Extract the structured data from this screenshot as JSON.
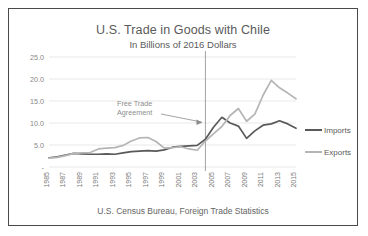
{
  "chart_data": {
    "type": "line",
    "title": "U.S. Trade in Goods with Chile",
    "subtitle": "In Billions of 2016 Dollars",
    "source_note": "U.S. Census Bureau, Foreign Trade Statistics",
    "xlabel": "",
    "ylabel": "",
    "ylim": [
      0,
      25
    ],
    "ytick_labels": [
      "25.0",
      "20.0",
      "15.0",
      "10.0",
      "5.0",
      "-"
    ],
    "ytick_values": [
      25,
      20,
      15,
      10,
      5,
      0
    ],
    "grid": true,
    "legend_position": "right",
    "x": [
      1985,
      1986,
      1987,
      1988,
      1989,
      1990,
      1991,
      1992,
      1993,
      1994,
      1995,
      1996,
      1997,
      1998,
      1999,
      2000,
      2001,
      2002,
      2003,
      2004,
      2005,
      2006,
      2007,
      2008,
      2009,
      2010,
      2011,
      2012,
      2013,
      2014,
      2015
    ],
    "xtick_labels": [
      "1985",
      "1987",
      "1989",
      "1991",
      "1993",
      "1995",
      "1997",
      "1999",
      "2001",
      "2003",
      "2005",
      "2007",
      "2009",
      "2011",
      "2013",
      "2015"
    ],
    "xtick_values": [
      1985,
      1987,
      1989,
      1991,
      1993,
      1995,
      1997,
      1999,
      2001,
      2003,
      2005,
      2007,
      2009,
      2011,
      2013,
      2015
    ],
    "series": [
      {
        "name": "Imports",
        "color": "#595959",
        "values": [
          2.1,
          2.3,
          2.7,
          3.1,
          3.0,
          2.9,
          2.9,
          3.0,
          2.9,
          3.2,
          3.5,
          3.6,
          3.7,
          3.6,
          3.9,
          4.5,
          4.7,
          4.8,
          4.9,
          6.3,
          9.1,
          11.3,
          10.0,
          9.3,
          6.5,
          8.2,
          9.5,
          9.8,
          10.5,
          9.8,
          8.8
        ]
      },
      {
        "name": "Exports",
        "color": "#b5b5b5",
        "values": [
          2.0,
          2.2,
          2.6,
          3.1,
          3.2,
          3.3,
          4.1,
          4.3,
          4.4,
          4.9,
          5.9,
          6.6,
          6.7,
          5.8,
          4.3,
          4.4,
          4.6,
          4.1,
          3.8,
          5.9,
          7.6,
          9.2,
          11.7,
          13.3,
          10.4,
          12.0,
          16.3,
          19.7,
          18.0,
          16.8,
          15.5
        ]
      }
    ],
    "annotations": [
      {
        "name": "free-trade-agreement",
        "line1": "Free Trade",
        "line2": "Agreement",
        "marker_x": 2004
      }
    ]
  }
}
